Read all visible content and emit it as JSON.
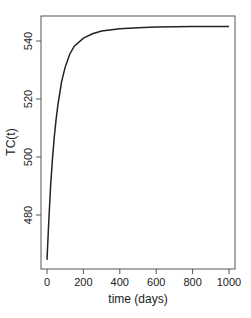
{
  "chart_data": {
    "type": "line",
    "title": "",
    "xlabel": "time (days)",
    "ylabel": "TC(t)",
    "xlim": [
      -30,
      1030
    ],
    "ylim": [
      462,
      548
    ],
    "x_ticks": [
      0,
      200,
      400,
      600,
      800,
      1000
    ],
    "y_ticks": [
      480,
      500,
      520,
      540
    ],
    "grid": false,
    "legend": null,
    "series": [
      {
        "name": "TC(t)",
        "color": "#222222",
        "x": [
          0,
          10,
          20,
          30,
          40,
          50,
          60,
          80,
          100,
          125,
          150,
          200,
          250,
          300,
          400,
          500,
          600,
          700,
          800,
          900,
          1000
        ],
        "y": [
          464.5,
          478,
          490,
          499.5,
          507,
          513,
          518,
          526,
          531,
          535.5,
          538.2,
          541,
          542.5,
          543.4,
          544.2,
          544.6,
          544.8,
          544.9,
          545,
          545,
          545
        ]
      }
    ]
  }
}
